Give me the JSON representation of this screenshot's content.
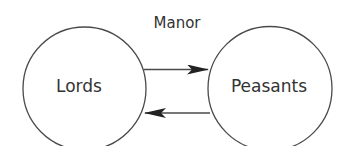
{
  "diagram": {
    "title": "Manor",
    "colors": {
      "stroke": "#4a4a4a",
      "text": "#333333",
      "background": "#ffffff"
    },
    "nodes": [
      {
        "id": "lords",
        "label": "Lords",
        "shape": "circle",
        "cx": 84.5,
        "cy": 88.5,
        "r": 61.5
      },
      {
        "id": "peasants",
        "label": "Peasants",
        "shape": "circle",
        "cx": 270,
        "cy": 88.5,
        "r": 62
      }
    ],
    "edges": [
      {
        "from": "lords",
        "to": "peasants",
        "direction": "right",
        "y": 69
      },
      {
        "from": "peasants",
        "to": "lords",
        "direction": "left",
        "y": 113
      }
    ]
  }
}
